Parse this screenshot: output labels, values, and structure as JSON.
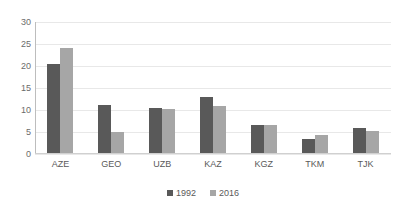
{
  "chart_data": {
    "type": "bar",
    "title": "",
    "subtitle": "",
    "xlabel": "",
    "ylabel": "",
    "categories": [
      "AZE",
      "GEO",
      "UZB",
      "KAZ",
      "KGZ",
      "TKM",
      "TJK"
    ],
    "series": [
      {
        "name": "1992",
        "color": "#595959",
        "values": [
          20.5,
          11.2,
          10.4,
          12.9,
          6.6,
          3.4,
          6.0
        ]
      },
      {
        "name": "2016",
        "color": "#a6a6a6",
        "values": [
          24.2,
          4.9,
          10.3,
          11.0,
          6.5,
          4.3,
          5.2
        ]
      }
    ],
    "ylim": [
      0,
      30
    ],
    "yticks": [
      0,
      5,
      10,
      15,
      20,
      25,
      30
    ],
    "ytick_labels": [
      "0",
      "5",
      "10",
      "15",
      "20",
      "25",
      "30"
    ],
    "grid": "horizontal",
    "legend_position": "bottom-center",
    "legend_entries": [
      "1992",
      "2016"
    ],
    "annotations": []
  }
}
